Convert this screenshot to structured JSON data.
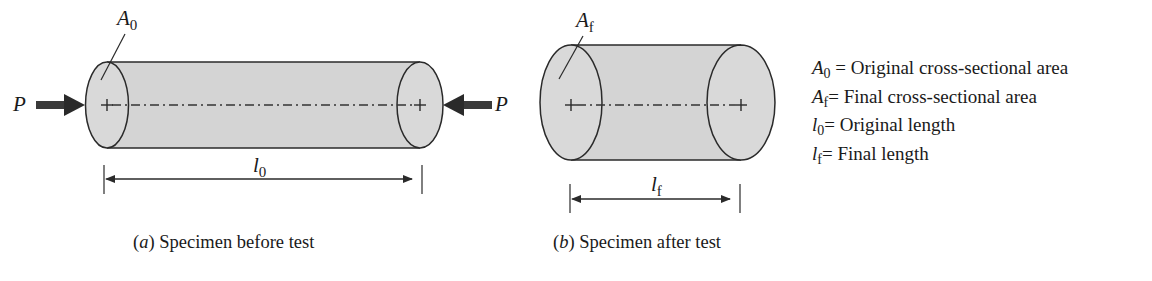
{
  "figure": {
    "colors": {
      "fill": "#d4d4d4",
      "stroke": "#2a2a2a",
      "background": "#ffffff"
    },
    "specimen_a": {
      "load_symbol": "P",
      "area_label": {
        "symbol": "A",
        "subscript": "0"
      },
      "length_label": {
        "symbol": "l",
        "subscript": "0"
      },
      "caption": {
        "letter": "a",
        "text": " Specimen before test"
      }
    },
    "specimen_b": {
      "area_label": {
        "symbol": "A",
        "subscript": "f"
      },
      "length_label": {
        "symbol": "l",
        "subscript": "f"
      },
      "caption": {
        "letter": "b",
        "text": " Specimen after test"
      }
    },
    "legend": [
      {
        "symbol": "A",
        "subscript": "0",
        "text": " = Original cross-sectional area"
      },
      {
        "symbol": "A",
        "subscript": "f",
        "text": "= Final cross-sectional area"
      },
      {
        "symbol": "l",
        "subscript": "0",
        "text": "= Original length"
      },
      {
        "symbol": "l",
        "subscript": "f",
        "text": "= Final length"
      }
    ]
  }
}
